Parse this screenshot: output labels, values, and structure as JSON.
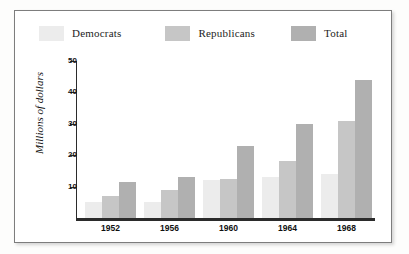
{
  "chart_data": {
    "type": "bar",
    "title": "",
    "subtitle": "",
    "xlabel": "",
    "ylabel": "Millions of dollars",
    "categories": [
      "1952",
      "1956",
      "1960",
      "1964",
      "1968"
    ],
    "series": [
      {
        "name": "Democrats",
        "color": "#ececec",
        "values": [
          5,
          5,
          12,
          13,
          14
        ]
      },
      {
        "name": "Republicans",
        "color": "#c6c6c6",
        "values": [
          7,
          9,
          12.5,
          18,
          31
        ]
      },
      {
        "name": "Total",
        "color": "#b0b0b0",
        "values": [
          11.5,
          13,
          23,
          30,
          44
        ]
      }
    ],
    "ylim": [
      0,
      50
    ],
    "yticks": [
      10,
      20,
      30,
      40,
      50
    ],
    "ytick_labels": [
      "10",
      "20",
      "30",
      "40",
      "50"
    ],
    "grid": false,
    "legend_position": "top-left"
  },
  "legend": {
    "entries": [
      {
        "label": "Democrats"
      },
      {
        "label": "Republicans"
      },
      {
        "label": "Total"
      }
    ]
  },
  "colors": {
    "democrats": "#ececec",
    "republicans": "#c6c6c6",
    "total": "#b0b0b0",
    "axis": "#2b2b2b",
    "frame": "#7d7d7d",
    "background": "#ffffff"
  }
}
